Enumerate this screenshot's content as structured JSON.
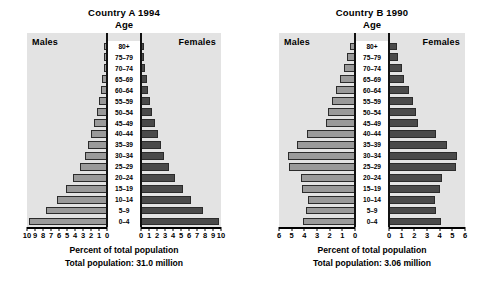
{
  "chart_data": [
    {
      "type": "bar",
      "title": "Country A 1994",
      "subtitle": "Age",
      "xlabel": "Percent of total population",
      "ylabel": "Age",
      "footnote": "Total population: 31.0 million",
      "left_series_label": "Males",
      "right_series_label": "Females",
      "categories": [
        "80+",
        "75–79",
        "70–74",
        "65–69",
        "60–64",
        "55–59",
        "50–54",
        "45–49",
        "40–44",
        "35–39",
        "30–34",
        "25–29",
        "20–24",
        "15–19",
        "10–14",
        "5–9",
        "0–4"
      ],
      "series": [
        {
          "name": "Males",
          "values": [
            0.2,
            0.3,
            0.4,
            0.6,
            0.8,
            1.0,
            1.3,
            1.6,
            2.0,
            2.4,
            2.8,
            3.4,
            4.2,
            5.1,
            6.2,
            7.6,
            9.7
          ]
        },
        {
          "name": "Females",
          "values": [
            0.3,
            0.35,
            0.45,
            0.7,
            0.9,
            1.1,
            1.4,
            1.7,
            2.1,
            2.5,
            2.9,
            3.5,
            4.3,
            5.2,
            6.3,
            7.7,
            9.8
          ]
        }
      ],
      "xlim": [
        0,
        10
      ],
      "xticks": [
        0,
        1,
        2,
        3,
        4,
        5,
        6,
        7,
        8,
        9,
        10
      ],
      "left_ticklabels": [
        "10",
        "9",
        "8",
        "7",
        "6",
        "5",
        "4",
        "3",
        "2",
        "1",
        "0"
      ],
      "right_ticklabels": [
        "0",
        "1",
        "2",
        "3",
        "4",
        "5",
        "6",
        "7",
        "8",
        "9",
        "10"
      ],
      "grid": false,
      "legend": "none"
    },
    {
      "type": "bar",
      "title": "Country B 1990",
      "subtitle": "Age",
      "xlabel": "Percent of total population",
      "ylabel": "Age",
      "footnote": "Total population: 3.06 million",
      "left_series_label": "Males",
      "right_series_label": "Females",
      "categories": [
        "80+",
        "75–79",
        "70–74",
        "65–69",
        "60–64",
        "55–59",
        "50–54",
        "45–49",
        "40–44",
        "35–39",
        "30–34",
        "25–29",
        "20–24",
        "15–19",
        "10–14",
        "5–9",
        "0–4"
      ],
      "series": [
        {
          "name": "Males",
          "values": [
            0.4,
            0.6,
            0.9,
            1.2,
            1.5,
            1.8,
            2.1,
            2.3,
            3.8,
            4.6,
            5.3,
            5.2,
            4.3,
            4.2,
            3.7,
            3.9,
            4.1
          ]
        },
        {
          "name": "Females",
          "values": [
            0.6,
            0.7,
            1.0,
            1.2,
            1.6,
            1.9,
            2.1,
            2.3,
            3.7,
            4.6,
            5.4,
            5.3,
            4.2,
            4.0,
            3.6,
            3.7,
            4.1
          ]
        }
      ],
      "xlim": [
        0,
        6
      ],
      "xticks": [
        0,
        1,
        2,
        3,
        4,
        5,
        6
      ],
      "left_ticklabels": [
        "6",
        "5",
        "4",
        "3",
        "2",
        "1",
        "0"
      ],
      "right_ticklabels": [
        "0",
        "1",
        "2",
        "3",
        "4",
        "5",
        "6"
      ],
      "grid": false,
      "legend": "none"
    }
  ],
  "colors": {
    "male_bar": "#9a9a9a",
    "female_bar": "#4a4a4a",
    "plot_background": "#e3e3e3",
    "axis": "#000000",
    "page_background": "#ffffff"
  }
}
